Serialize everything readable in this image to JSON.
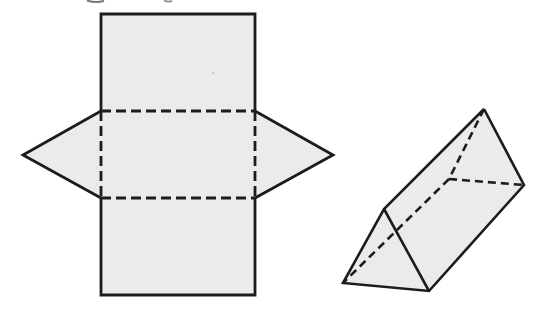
{
  "page": {
    "width": 558,
    "height": 314,
    "background": "#ffffff"
  },
  "colors": {
    "shape_fill": "#ebebe9",
    "stroke": "#1c1c1c",
    "artifact": "#4a4a4a",
    "speck": "#c9c9c6"
  },
  "figures": [
    {
      "name": "prism-net-figure",
      "role": "net of a triangular prism: vertical rectangle of three panels with fold lines, triangles attached left and right of middle panel",
      "stroke_width": 2.8,
      "dash": [
        10,
        5
      ],
      "shapes": [
        {
          "kind": "polygon",
          "fill": true,
          "stroke": "none",
          "points": [
            [
              101,
              14
            ],
            [
              255,
              14
            ],
            [
              255,
              111
            ],
            [
              333,
              155
            ],
            [
              255,
              198
            ],
            [
              255,
              295
            ],
            [
              101,
              295
            ],
            [
              101,
              198
            ],
            [
              23,
              155
            ],
            [
              101,
              111
            ]
          ]
        },
        {
          "kind": "polyline",
          "stroke": "solid",
          "points": [
            [
              101,
              111
            ],
            [
              101,
              14
            ],
            [
              255,
              14
            ],
            [
              255,
              111
            ]
          ]
        },
        {
          "kind": "polyline",
          "stroke": "solid",
          "points": [
            [
              101,
              198
            ],
            [
              101,
              295
            ],
            [
              255,
              295
            ],
            [
              255,
              198
            ]
          ]
        },
        {
          "kind": "polyline",
          "stroke": "solid",
          "points": [
            [
              101,
              111
            ],
            [
              23,
              155
            ],
            [
              101,
              198
            ]
          ]
        },
        {
          "kind": "polyline",
          "stroke": "solid",
          "points": [
            [
              255,
              111
            ],
            [
              333,
              155
            ],
            [
              255,
              198
            ]
          ]
        },
        {
          "kind": "polyline",
          "stroke": "dashed",
          "points": [
            [
              101,
              111
            ],
            [
              255,
              111
            ]
          ]
        },
        {
          "kind": "polyline",
          "stroke": "dashed",
          "points": [
            [
              101,
              198
            ],
            [
              255,
              198
            ]
          ]
        },
        {
          "kind": "polyline",
          "stroke": "dashed",
          "points": [
            [
              101,
              111
            ],
            [
              101,
              198
            ]
          ]
        },
        {
          "kind": "polyline",
          "stroke": "dashed",
          "points": [
            [
              255,
              111
            ],
            [
              255,
              198
            ]
          ]
        }
      ]
    },
    {
      "name": "prism-3d-figure",
      "role": "tilted triangular prism with hidden edges dashed",
      "stroke_width": 2.6,
      "dash": [
        8,
        5
      ],
      "shapes": [
        {
          "kind": "polygon",
          "fill": true,
          "stroke": "none",
          "points": [
            [
              484,
              109
            ],
            [
              524,
              185
            ],
            [
              429,
              291
            ],
            [
              343,
              283
            ],
            [
              384,
              209
            ]
          ]
        },
        {
          "kind": "polyline",
          "stroke": "solid",
          "points": [
            [
              484,
              109
            ],
            [
              524,
              185
            ],
            [
              429,
              291
            ],
            [
              343,
              283
            ],
            [
              384,
              209
            ],
            [
              484,
              109
            ]
          ]
        },
        {
          "kind": "polyline",
          "stroke": "solid",
          "points": [
            [
              384,
              209
            ],
            [
              429,
              291
            ]
          ]
        },
        {
          "kind": "polyline",
          "stroke": "dashed",
          "points": [
            [
              484,
              109
            ],
            [
              449,
              179
            ]
          ]
        },
        {
          "kind": "polyline",
          "stroke": "dashed",
          "points": [
            [
              449,
              179
            ],
            [
              524,
              185
            ]
          ]
        },
        {
          "kind": "polyline",
          "stroke": "dashed",
          "points": [
            [
              449,
              179
            ],
            [
              343,
              283
            ]
          ]
        }
      ]
    },
    {
      "name": "cropped-text-artifacts",
      "role": "faint descender remnants of text cropped at top edge and a scan speck",
      "stroke_width": 1.8,
      "dash": [
        4,
        3
      ],
      "shapes": [
        {
          "kind": "path",
          "stroke": "solid",
          "width": 2.0,
          "color": "#4a4a4a",
          "opacity": 0.75,
          "d": "M 87 0.5 Q 96 3.5 104 0.8"
        },
        {
          "kind": "path",
          "stroke": "solid",
          "width": 1.8,
          "color": "#4a4a4a",
          "opacity": 0.6,
          "d": "M 164 0.5 Q 168 2.5 172 0.8"
        },
        {
          "kind": "circle",
          "cx": 213,
          "cy": 73,
          "r": 1.2,
          "color": "#c9c9c6",
          "opacity": 0.9
        }
      ]
    }
  ]
}
